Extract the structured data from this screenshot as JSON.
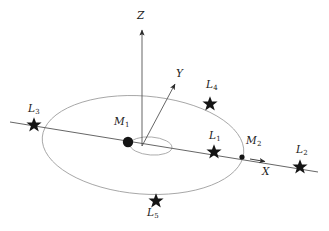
{
  "figure": {
    "background_color": "#ffffff",
    "stroke_color": "#3a3a3a",
    "orbit_color": "#9a9a9a",
    "marker_color": "#141414",
    "width": 329,
    "height": 231
  },
  "axes": [
    {
      "id": "z-axis",
      "label": "Z",
      "from": [
        142,
        146
      ],
      "to": [
        142,
        28
      ],
      "arrow": true
    },
    {
      "id": "y-axis",
      "label": "Y",
      "from": [
        142,
        146
      ],
      "to": [
        176,
        83
      ],
      "arrow": true
    },
    {
      "id": "x-axis",
      "label": "X",
      "from": [
        10,
        122
      ],
      "to": [
        318,
        172
      ],
      "arrow": true,
      "arrow_at": [
        266,
        163
      ]
    }
  ],
  "axis_labels": {
    "z": {
      "text": "Z",
      "x": 137,
      "y": 10
    },
    "y": {
      "text": "Y",
      "x": 176,
      "y": 68
    },
    "x": {
      "text": "X",
      "x": 262,
      "y": 168
    }
  },
  "bodies": [
    {
      "id": "primary",
      "label": "M",
      "subscript": "1",
      "marker": "dot",
      "x": 128,
      "y": 142,
      "label_x": 114,
      "label_y": 117,
      "size": 5.2
    },
    {
      "id": "secondary",
      "label": "M",
      "subscript": "2",
      "marker": "dot",
      "x": 242,
      "y": 157,
      "label_x": 246,
      "label_y": 136,
      "size": 2.6
    }
  ],
  "lagrange_points": [
    {
      "id": "L1",
      "label": "L",
      "subscript": "1",
      "marker": "star",
      "x": 214,
      "y": 152,
      "label_x": 209,
      "label_y": 131,
      "size": 7.5
    },
    {
      "id": "L2",
      "label": "L",
      "subscript": "2",
      "marker": "star",
      "x": 300,
      "y": 167,
      "label_x": 296,
      "label_y": 145,
      "size": 7.5
    },
    {
      "id": "L3",
      "label": "L",
      "subscript": "3",
      "marker": "star",
      "x": 34,
      "y": 125,
      "label_x": 29,
      "label_y": 104,
      "size": 7.5
    },
    {
      "id": "L4",
      "label": "L",
      "subscript": "4",
      "marker": "star",
      "x": 210,
      "y": 104,
      "label_x": 207,
      "label_y": 80,
      "size": 7.5
    },
    {
      "id": "L5",
      "label": "L",
      "subscript": "5",
      "marker": "star",
      "x": 156,
      "y": 201,
      "label_x": 147,
      "label_y": 207,
      "size": 7.5
    }
  ],
  "orbits": [
    {
      "id": "secondary-orbit",
      "shape": "ellipse",
      "cx": 143,
      "cy": 145,
      "rx": 101,
      "ry": 49,
      "rotation": 4.5
    },
    {
      "id": "primary-orbit",
      "shape": "ellipse",
      "cx": 151,
      "cy": 146,
      "rx": 21,
      "ry": 9,
      "rotation": 4.5
    }
  ]
}
